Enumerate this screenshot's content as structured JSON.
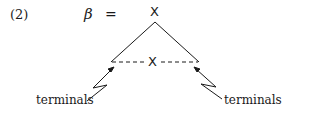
{
  "example_number": "(2)",
  "equation": {
    "lhs": "β",
    "equals": "="
  },
  "tree": {
    "root_label": "X",
    "foot_label": "X",
    "frontier_style": "dashed"
  },
  "annotations": [
    {
      "label": "terminals",
      "side": "left"
    },
    {
      "label": "terminals",
      "side": "right"
    }
  ],
  "colors": {
    "ink": "#1a1a1a",
    "background": "#ffffff"
  }
}
